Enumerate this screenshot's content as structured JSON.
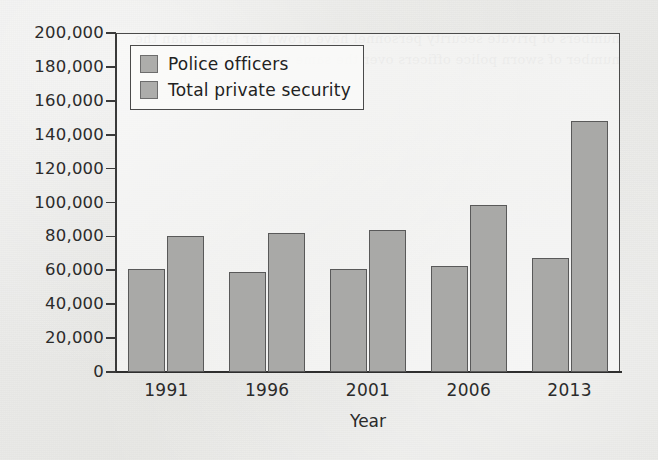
{
  "chart_data": {
    "type": "bar",
    "title": "",
    "subtitle": "",
    "xlabel": "Year",
    "ylabel": "",
    "categories": [
      "1991",
      "1996",
      "2001",
      "2006",
      "2013"
    ],
    "series": [
      {
        "name": "Police officers",
        "values": [
          60500,
          59000,
          61000,
          62500,
          67000
        ]
      },
      {
        "name": "Total private security",
        "values": [
          80500,
          82000,
          83500,
          98500,
          148000
        ]
      }
    ],
    "ylim": [
      0,
      200000
    ],
    "ytick_values": [
      0,
      20000,
      40000,
      60000,
      80000,
      100000,
      120000,
      140000,
      160000,
      180000,
      200000
    ],
    "ytick_labels": [
      "0",
      "20,000",
      "40,000",
      "60,000",
      "80,000",
      "100,000",
      "120,000",
      "140,000",
      "160,000",
      "180,000",
      "200,000"
    ],
    "grid": false,
    "legend_position": "upper-left-inside",
    "bar_fill_color": "#a9a9a7",
    "bar_border_color": "#595959",
    "axis_color": "#2f2f2f",
    "background_color": "#e9e9e7"
  },
  "legend": {
    "items": [
      {
        "label": "Police officers",
        "color": "#a9a9a7"
      },
      {
        "label": "Total private security",
        "color": "#a9a9a7"
      }
    ]
  },
  "axes": {
    "x_title": "Year"
  },
  "bleed_text": "numbers of private security personnel have grown far faster than the number of sworn police officers over the same period of years"
}
